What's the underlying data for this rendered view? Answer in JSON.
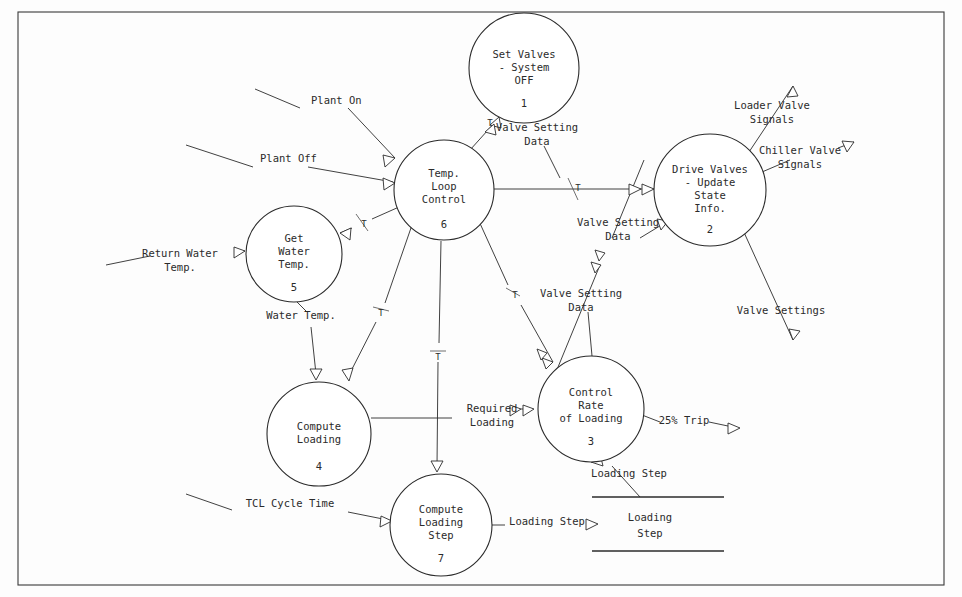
{
  "diagram": {
    "type": "data-flow-diagram",
    "frame": {
      "border_color": "#3a3a3a"
    },
    "processes": [
      {
        "id": "p1",
        "number": "1",
        "lines": [
          "Set Valves",
          "- System",
          "OFF"
        ],
        "cx": 524,
        "cy": 68,
        "r": 55
      },
      {
        "id": "p6",
        "number": "6",
        "lines": [
          "Temp.",
          "Loop",
          "Control"
        ],
        "cx": 444,
        "cy": 190,
        "r": 50
      },
      {
        "id": "p2",
        "number": "2",
        "lines": [
          "Drive Valves",
          "- Update",
          "State",
          "Info."
        ],
        "cx": 710,
        "cy": 190,
        "r": 56
      },
      {
        "id": "p5",
        "number": "5",
        "lines": [
          "Get",
          "Water",
          "Temp."
        ],
        "cx": 294,
        "cy": 254,
        "r": 48
      },
      {
        "id": "p3",
        "number": "3",
        "lines": [
          "Control",
          "Rate",
          "of Loading"
        ],
        "cx": 591,
        "cy": 409,
        "r": 53
      },
      {
        "id": "p4",
        "number": "4",
        "lines": [
          "Compute",
          "Loading"
        ],
        "cx": 319,
        "cy": 434,
        "r": 52
      },
      {
        "id": "p7",
        "number": "7",
        "lines": [
          "Compute",
          "Loading",
          "Step"
        ],
        "cx": 441,
        "cy": 525,
        "r": 51
      }
    ],
    "data_stores": [
      {
        "id": "ds1",
        "lines": [
          "Loading",
          "Step"
        ],
        "x1": 592,
        "x2": 724,
        "y_top": 497,
        "y_bottom": 551
      }
    ],
    "flow_labels": [
      {
        "id": "plant-on",
        "text": "Plant On",
        "x": 311,
        "y": 104
      },
      {
        "id": "plant-off",
        "text": "Plant Off",
        "x": 260,
        "y": 162
      },
      {
        "id": "valve-setting-data-1",
        "lines": [
          "Valve Setting",
          "Data"
        ],
        "x": 537,
        "y": 131
      },
      {
        "id": "loader-valve-signals",
        "lines": [
          "Loader Valve",
          "Signals"
        ],
        "x": 772,
        "y": 109
      },
      {
        "id": "chiller-valve-signals",
        "lines": [
          "Chiller Valve",
          "Signals"
        ],
        "x": 800,
        "y": 154
      },
      {
        "id": "valve-setting-data-2",
        "lines": [
          "Valve Setting",
          "Data"
        ],
        "x": 618,
        "y": 226
      },
      {
        "id": "valve-setting-data-3",
        "lines": [
          "Valve Setting",
          "Data"
        ],
        "x": 581,
        "y": 297
      },
      {
        "id": "return-water-temp",
        "lines": [
          "Return Water",
          "Temp."
        ],
        "x": 180,
        "y": 257
      },
      {
        "id": "valve-settings",
        "text": "Valve Settings",
        "x": 781,
        "y": 314
      },
      {
        "id": "water-temp",
        "text": "Water Temp.",
        "x": 301,
        "y": 319
      },
      {
        "id": "required-loading",
        "lines": [
          "Required",
          "Loading"
        ],
        "x": 492,
        "y": 412
      },
      {
        "id": "trip-25",
        "text": "25% Trip",
        "x": 684,
        "y": 424
      },
      {
        "id": "loading-step-in",
        "text": "Loading Step",
        "x": 629,
        "y": 477
      },
      {
        "id": "tcl-cycle-time",
        "text": "TCL Cycle Time",
        "x": 290,
        "y": 507
      },
      {
        "id": "loading-step-out",
        "text": "Loading Step",
        "x": 547,
        "y": 525
      }
    ],
    "t_markers": [
      {
        "id": "t-p1",
        "x": 490,
        "y": 122
      },
      {
        "id": "t-p2",
        "x": 575,
        "y": 188
      },
      {
        "id": "t-p5",
        "x": 362,
        "y": 223
      },
      {
        "id": "t-p4",
        "x": 380,
        "y": 312
      },
      {
        "id": "t-p7",
        "x": 437,
        "y": 352
      },
      {
        "id": "t-p3",
        "x": 514,
        "y": 294
      }
    ]
  }
}
